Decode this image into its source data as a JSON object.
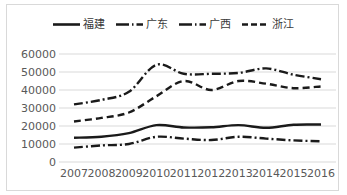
{
  "chart_data": {
    "type": "line",
    "title": "",
    "xlabel": "",
    "ylabel": "",
    "x": [
      "2007",
      "2008",
      "2009",
      "2010",
      "2011",
      "2012",
      "2013",
      "2014",
      "2015",
      "2016"
    ],
    "ylim": [
      0,
      60000
    ],
    "ytick_labels": [
      "60000",
      "50000",
      "40000",
      "30000",
      "20000",
      "10000",
      "0"
    ],
    "ytick_values": [
      60000,
      50000,
      40000,
      30000,
      20000,
      10000,
      0
    ],
    "grid": true,
    "legend_position": "top",
    "series": [
      {
        "name": "福建",
        "style": "solid",
        "color": "#1a1a1a",
        "values": [
          13500,
          14000,
          16000,
          20500,
          19200,
          19300,
          20500,
          19000,
          20700,
          20800
        ]
      },
      {
        "name": "广东",
        "style": "dash-dot",
        "color": "#1a1a1a",
        "values": [
          32000,
          34500,
          39000,
          54000,
          49000,
          49000,
          49500,
          52000,
          48500,
          46000
        ]
      },
      {
        "name": "广西",
        "style": "dash-dot",
        "color": "#1a1a1a",
        "values": [
          8000,
          9200,
          10000,
          14000,
          13000,
          12200,
          14000,
          13000,
          12000,
          11500
        ]
      },
      {
        "name": "浙江",
        "style": "dashed",
        "color": "#1a1a1a",
        "values": [
          22500,
          24500,
          27500,
          36500,
          45000,
          40000,
          45000,
          43500,
          41000,
          42000
        ]
      }
    ]
  },
  "legend": {
    "items": [
      {
        "label": "福建",
        "swatch": "solid-line-swatch"
      },
      {
        "label": "广东",
        "swatch": "dash-dot-line-swatch"
      },
      {
        "label": "广西",
        "swatch": "dash-dot-line-swatch"
      },
      {
        "label": "浙江",
        "swatch": "dashed-line-swatch"
      }
    ]
  }
}
